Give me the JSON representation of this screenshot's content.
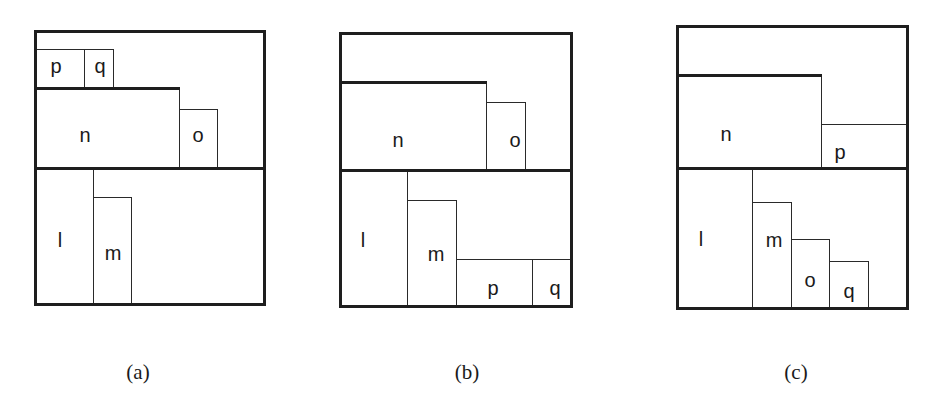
{
  "figure": {
    "panels": [
      {
        "id": "a",
        "caption": "(a)",
        "caption_pos": [
          138,
          372
        ],
        "outer": {
          "x": 34,
          "y": 30,
          "w": 232,
          "h": 276
        },
        "bold_lines": [
          {
            "x": 34,
            "y": 87,
            "w": 146
          },
          {
            "x": 34,
            "y": 167,
            "w": 232
          }
        ],
        "rects": [
          {
            "name": "p",
            "label": "p",
            "x": 35,
            "y": 49,
            "w": 50,
            "h": 39,
            "lx": 56,
            "ly": 66
          },
          {
            "name": "q",
            "label": "q",
            "x": 84,
            "y": 49,
            "w": 30,
            "h": 39,
            "lx": 100,
            "ly": 66
          },
          {
            "name": "n",
            "label": "n",
            "x": 35,
            "y": 88,
            "w": 145,
            "h": 81,
            "lx": 85,
            "ly": 135
          },
          {
            "name": "o",
            "label": "o",
            "x": 179,
            "y": 109,
            "w": 39,
            "h": 60,
            "lx": 198,
            "ly": 135
          },
          {
            "name": "l",
            "label": "l",
            "x": 35,
            "y": 168,
            "w": 59,
            "h": 137,
            "lx": 60,
            "ly": 240
          },
          {
            "name": "m",
            "label": "m",
            "x": 93,
            "y": 197,
            "w": 39,
            "h": 108,
            "lx": 113,
            "ly": 253
          }
        ]
      },
      {
        "id": "b",
        "caption": "(b)",
        "caption_pos": [
          467,
          372
        ],
        "outer": {
          "x": 339,
          "y": 32,
          "w": 234,
          "h": 276
        },
        "bold_lines": [
          {
            "x": 339,
            "y": 81,
            "w": 148
          },
          {
            "x": 339,
            "y": 169,
            "w": 234
          }
        ],
        "rects": [
          {
            "name": "n",
            "label": "n",
            "x": 340,
            "y": 82,
            "w": 147,
            "h": 88,
            "lx": 398,
            "ly": 140
          },
          {
            "name": "o",
            "label": "o",
            "x": 486,
            "y": 102,
            "w": 40,
            "h": 68,
            "lx": 515,
            "ly": 140
          },
          {
            "name": "l",
            "label": "l",
            "x": 340,
            "y": 170,
            "w": 68,
            "h": 137,
            "lx": 363,
            "ly": 240
          },
          {
            "name": "m",
            "label": "m",
            "x": 407,
            "y": 200,
            "w": 50,
            "h": 107,
            "lx": 436,
            "ly": 254
          },
          {
            "name": "p",
            "label": "p",
            "x": 456,
            "y": 259,
            "w": 77,
            "h": 48,
            "lx": 493,
            "ly": 288
          },
          {
            "name": "q",
            "label": "q",
            "x": 532,
            "y": 259,
            "w": 41,
            "h": 48,
            "lx": 555,
            "ly": 288
          }
        ]
      },
      {
        "id": "c",
        "caption": "(c)",
        "caption_pos": [
          796,
          372
        ],
        "outer": {
          "x": 676,
          "y": 25,
          "w": 233,
          "h": 285
        },
        "bold_lines": [
          {
            "x": 676,
            "y": 74,
            "w": 146
          },
          {
            "x": 676,
            "y": 167,
            "w": 233
          }
        ],
        "rects": [
          {
            "name": "n",
            "label": "n",
            "x": 677,
            "y": 75,
            "w": 145,
            "h": 93,
            "lx": 726,
            "ly": 134
          },
          {
            "name": "p",
            "label": "p",
            "x": 821,
            "y": 124,
            "w": 86,
            "h": 44,
            "lx": 840,
            "ly": 152
          },
          {
            "name": "l",
            "label": "l",
            "x": 677,
            "y": 168,
            "w": 76,
            "h": 141,
            "lx": 701,
            "ly": 239
          },
          {
            "name": "m",
            "label": "m",
            "x": 752,
            "y": 202,
            "w": 40,
            "h": 107,
            "lx": 774,
            "ly": 240
          },
          {
            "name": "o",
            "label": "o",
            "x": 791,
            "y": 239,
            "w": 39,
            "h": 70,
            "lx": 810,
            "ly": 280
          },
          {
            "name": "q",
            "label": "q",
            "x": 829,
            "y": 261,
            "w": 40,
            "h": 48,
            "lx": 849,
            "ly": 291
          }
        ]
      }
    ]
  }
}
